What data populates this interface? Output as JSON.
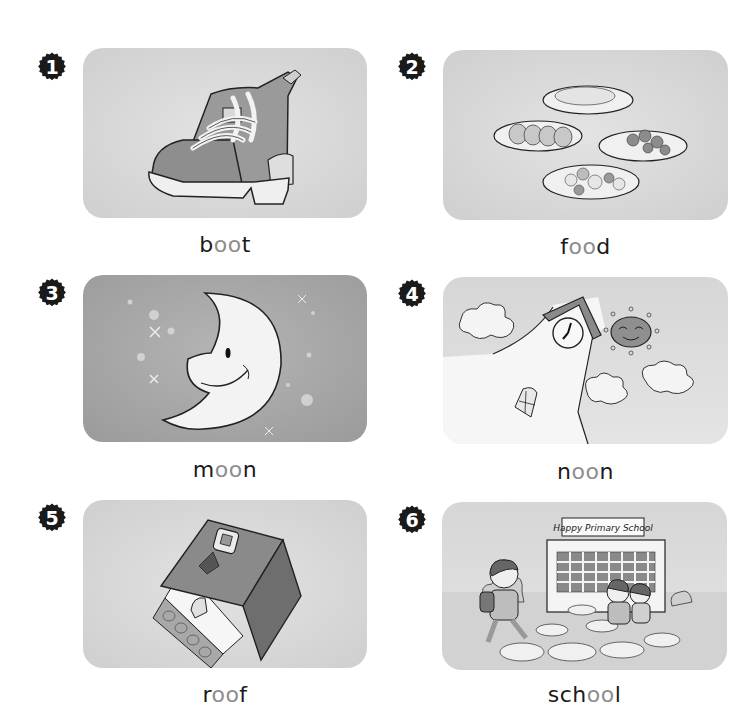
{
  "colors": {
    "text": "#1a1a1a",
    "highlight": "#8d8d8d",
    "badge": "#1a1a1a",
    "card_light": "#d9d9d9",
    "card_dark": "#a6a6a6"
  },
  "phonics_pattern": "oo",
  "items": [
    {
      "number": "1",
      "word": "boot",
      "parts": {
        "before": "b",
        "vowel": "oo",
        "after": "t"
      },
      "image": "boot-illustration"
    },
    {
      "number": "2",
      "word": "food",
      "parts": {
        "before": "f",
        "vowel": "oo",
        "after": "d"
      },
      "image": "food-plates-illustration"
    },
    {
      "number": "3",
      "word": "moon",
      "parts": {
        "before": "m",
        "vowel": "oo",
        "after": "n"
      },
      "image": "crescent-moon-illustration"
    },
    {
      "number": "4",
      "word": "noon",
      "parts": {
        "before": "n",
        "vowel": "oo",
        "after": "n"
      },
      "image": "clock-tower-sun-illustration"
    },
    {
      "number": "5",
      "word": "roof",
      "parts": {
        "before": "r",
        "vowel": "oo",
        "after": "f"
      },
      "image": "house-roof-illustration"
    },
    {
      "number": "6",
      "word": "school",
      "parts": {
        "before": "sch",
        "vowel": "oo",
        "after": "l"
      },
      "image": "school-children-illustration",
      "sign_text": "Happy Primary School"
    }
  ]
}
